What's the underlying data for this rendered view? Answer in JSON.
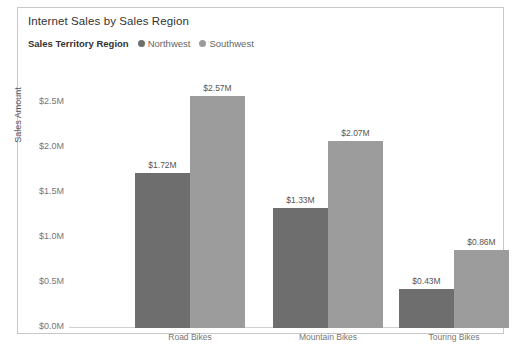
{
  "visual": {
    "title": "Internet Sales by Sales Region"
  },
  "legend": {
    "title": "Sales Territory Region",
    "items": [
      {
        "label": "Northwest",
        "color": "#6e6e6e"
      },
      {
        "label": "Southwest",
        "color": "#9c9c9c"
      }
    ]
  },
  "axes": {
    "y_title": "Sales Amount",
    "y_ticks": [
      "$2.5M",
      "$2.0M",
      "$1.5M",
      "$1.0M",
      "$0.5M",
      "$0.0M"
    ]
  },
  "chart_data": {
    "type": "bar",
    "title": "Internet Sales by Sales Region",
    "xlabel": "",
    "ylabel": "Sales Amount",
    "ylim": [
      0,
      2.75
    ],
    "grid": false,
    "legend_position": "top-left",
    "legend_title": "Sales Territory Region",
    "categories": [
      "Road Bikes",
      "Mountain Bikes",
      "Touring Bikes"
    ],
    "series": [
      {
        "name": "Northwest",
        "color": "#6e6e6e",
        "values": [
          1.72,
          1.33,
          0.43
        ],
        "labels": [
          "$1.72M",
          "$1.33M",
          "$0.43M"
        ]
      },
      {
        "name": "Southwest",
        "color": "#9c9c9c",
        "values": [
          2.57,
          2.07,
          0.86
        ],
        "labels": [
          "$2.57M",
          "$2.07M",
          "$0.86M"
        ]
      }
    ],
    "tick_values": [
      2.5,
      2.0,
      1.5,
      1.0,
      0.5,
      0.0
    ],
    "tick_labels": [
      "$2.5M",
      "$2.0M",
      "$1.5M",
      "$1.0M",
      "$0.5M",
      "$0.0M"
    ]
  }
}
